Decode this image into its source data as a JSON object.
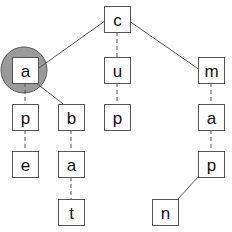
{
  "diagram": {
    "type": "trie",
    "colors": {
      "background": "#ffffff",
      "node_border": "#555555",
      "node_fill": "#ffffff",
      "edge": "#555555",
      "highlight_fill": "#9a9a9a",
      "highlight_border": "#555555",
      "text": "#111111"
    },
    "nodes": [
      {
        "id": "c",
        "label": "c",
        "x": 104,
        "y": 6
      },
      {
        "id": "a1",
        "label": "a",
        "x": 12,
        "y": 57,
        "highlighted": true
      },
      {
        "id": "u",
        "label": "u",
        "x": 104,
        "y": 57
      },
      {
        "id": "m",
        "label": "m",
        "x": 198,
        "y": 57
      },
      {
        "id": "p1",
        "label": "p",
        "x": 12,
        "y": 104
      },
      {
        "id": "b",
        "label": "b",
        "x": 58,
        "y": 104
      },
      {
        "id": "p2",
        "label": "p",
        "x": 104,
        "y": 104
      },
      {
        "id": "a2",
        "label": "a",
        "x": 198,
        "y": 104
      },
      {
        "id": "e",
        "label": "e",
        "x": 12,
        "y": 151
      },
      {
        "id": "a3",
        "label": "a",
        "x": 58,
        "y": 151
      },
      {
        "id": "p3",
        "label": "p",
        "x": 198,
        "y": 151
      },
      {
        "id": "t",
        "label": "t",
        "x": 58,
        "y": 199
      },
      {
        "id": "n",
        "label": "n",
        "x": 152,
        "y": 199
      }
    ],
    "edges": [
      {
        "from": "c",
        "to": "a1",
        "style": "solid"
      },
      {
        "from": "c",
        "to": "u",
        "style": "dashed"
      },
      {
        "from": "c",
        "to": "m",
        "style": "solid"
      },
      {
        "from": "a1",
        "to": "p1",
        "style": "dashed"
      },
      {
        "from": "a1",
        "to": "b",
        "style": "solid"
      },
      {
        "from": "u",
        "to": "p2",
        "style": "dashed"
      },
      {
        "from": "m",
        "to": "a2",
        "style": "dashed"
      },
      {
        "from": "p1",
        "to": "e",
        "style": "dashed"
      },
      {
        "from": "b",
        "to": "a3",
        "style": "dashed"
      },
      {
        "from": "a2",
        "to": "p3",
        "style": "dashed"
      },
      {
        "from": "a3",
        "to": "t",
        "style": "dashed"
      },
      {
        "from": "p3",
        "to": "n",
        "style": "solid"
      }
    ],
    "highlight": {
      "node": "a1",
      "cx": 24,
      "cy": 70,
      "r": 23
    }
  }
}
